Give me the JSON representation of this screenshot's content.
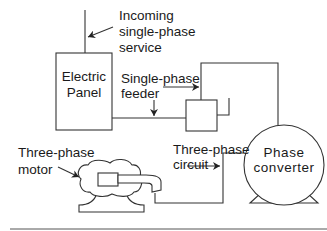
{
  "diagram": {
    "labels": {
      "incoming": [
        "Incoming",
        "single-phase",
        "service"
      ],
      "panel": [
        "Electric",
        "Panel"
      ],
      "feeder": [
        "Single-phase",
        "feeder"
      ],
      "motor": [
        "Three-phase",
        "motor"
      ],
      "circuit": [
        "Three-phase",
        "circuit"
      ],
      "converter": [
        "Phase",
        "converter"
      ]
    },
    "components": [
      {
        "id": "electric-panel",
        "type": "rectangle"
      },
      {
        "id": "disconnect-box",
        "type": "rectangle"
      },
      {
        "id": "phase-converter",
        "type": "circle-with-base"
      },
      {
        "id": "three-phase-motor",
        "type": "motor"
      }
    ],
    "connections": [
      {
        "from": "incoming-service",
        "to": "electric-panel"
      },
      {
        "from": "electric-panel",
        "to": "disconnect-box",
        "label": "Single-phase feeder"
      },
      {
        "from": "disconnect-box",
        "to": "phase-converter"
      },
      {
        "from": "phase-converter",
        "to": "three-phase-motor",
        "label": "Three-phase circuit"
      }
    ],
    "colors": {
      "stroke": "#333333",
      "text": "#1a1a1a",
      "background": "#ffffff"
    }
  }
}
